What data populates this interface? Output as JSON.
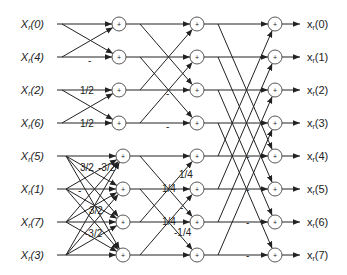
{
  "diagram": {
    "type": "signal-flow butterfly graph",
    "inputs": [
      "X_r(0)",
      "X_r(4)",
      "X_r(2)",
      "X_r(6)",
      "X_r(5)",
      "X_r(1)",
      "X_r(7)",
      "X_r(3)"
    ],
    "input_labels": [
      {
        "main": "X",
        "sub": "r",
        "idx": "(0)"
      },
      {
        "main": "X",
        "sub": "r",
        "idx": "(4)"
      },
      {
        "main": "X",
        "sub": "r",
        "idx": "(2)"
      },
      {
        "main": "X",
        "sub": "r",
        "idx": "(6)"
      },
      {
        "main": "X",
        "sub": "r",
        "idx": "(5)"
      },
      {
        "main": "X",
        "sub": "r",
        "idx": "(1)"
      },
      {
        "main": "X",
        "sub": "r",
        "idx": "(7)"
      },
      {
        "main": "X",
        "sub": "r",
        "idx": "(3)"
      }
    ],
    "output_labels": [
      {
        "main": "x",
        "sub": "r",
        "idx": "(0)"
      },
      {
        "main": "x",
        "sub": "r",
        "idx": "(1)"
      },
      {
        "main": "x",
        "sub": "r",
        "idx": "(2)"
      },
      {
        "main": "x",
        "sub": "r",
        "idx": "(3)"
      },
      {
        "main": "x",
        "sub": "r",
        "idx": "(4)"
      },
      {
        "main": "x",
        "sub": "r",
        "idx": "(5)"
      },
      {
        "main": "x",
        "sub": "r",
        "idx": "(6)"
      },
      {
        "main": "x",
        "sub": "r",
        "idx": "(7)"
      }
    ],
    "adder_symbol": "+",
    "rows_y": [
      24,
      57,
      90,
      123,
      156,
      189,
      222,
      255
    ],
    "stage_x": {
      "input_end": 57,
      "stage1_top": 119,
      "stage1_bottom": 123,
      "stage2": 197,
      "stage3": 275,
      "output_arrow_end": 300,
      "output_label": 303
    },
    "coefficients": [
      {
        "text": "-",
        "x": 88,
        "y": 64
      },
      {
        "text": "1/2",
        "x": 80,
        "y": 94
      },
      {
        "text": "1/2",
        "x": 80,
        "y": 127
      },
      {
        "text": "-",
        "x": 166,
        "y": 97
      },
      {
        "text": "-",
        "x": 166,
        "y": 130
      },
      {
        "text": "3/2",
        "x": 80,
        "y": 171
      },
      {
        "text": "-3/2",
        "x": 98,
        "y": 171
      },
      {
        "text": "-",
        "x": 78,
        "y": 194
      },
      {
        "text": "3/2",
        "x": 89,
        "y": 214
      },
      {
        "text": "-3/2",
        "x": 85,
        "y": 237
      },
      {
        "text": "1/4",
        "x": 179,
        "y": 178
      },
      {
        "text": "1/4",
        "x": 162,
        "y": 192
      },
      {
        "text": "-",
        "x": 180,
        "y": 211
      },
      {
        "text": "1/4",
        "x": 162,
        "y": 225
      },
      {
        "text": "-1/4",
        "x": 174,
        "y": 236
      },
      {
        "text": "-",
        "x": 246,
        "y": 160
      },
      {
        "text": "-",
        "x": 246,
        "y": 193
      },
      {
        "text": "-",
        "x": 246,
        "y": 226
      },
      {
        "text": "-",
        "x": 246,
        "y": 259
      }
    ]
  }
}
